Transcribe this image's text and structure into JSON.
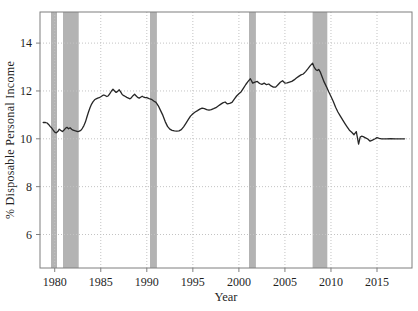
{
  "chart_data": {
    "type": "line",
    "title": "",
    "xlabel": "Year",
    "ylabel": "% Disposable Personal Income",
    "xlim": [
      1978.4,
      2018.8
    ],
    "ylim": [
      4.6,
      15.3
    ],
    "xticks": [
      1980,
      1985,
      1990,
      1995,
      2000,
      2005,
      2010,
      2015
    ],
    "yticks": [
      6,
      8,
      10,
      12,
      14
    ],
    "grid": "dotted, both axes",
    "legend": "none",
    "recession_bands": [
      [
        1979.6,
        1980.25
      ],
      [
        1980.9,
        1982.6
      ],
      [
        1990.35,
        1991.1
      ],
      [
        2001.1,
        2001.85
      ],
      [
        2008.0,
        2009.6
      ]
    ],
    "series": [
      {
        "name": "share of disposable personal income",
        "points": [
          [
            1978.75,
            10.68
          ],
          [
            1979.0,
            10.68
          ],
          [
            1979.17,
            10.66
          ],
          [
            1979.33,
            10.6
          ],
          [
            1979.5,
            10.52
          ],
          [
            1979.67,
            10.45
          ],
          [
            1979.83,
            10.36
          ],
          [
            1980.0,
            10.28
          ],
          [
            1980.17,
            10.25
          ],
          [
            1980.33,
            10.3
          ],
          [
            1980.5,
            10.4
          ],
          [
            1980.67,
            10.35
          ],
          [
            1980.83,
            10.3
          ],
          [
            1981.0,
            10.36
          ],
          [
            1981.17,
            10.44
          ],
          [
            1981.33,
            10.48
          ],
          [
            1981.5,
            10.42
          ],
          [
            1981.67,
            10.46
          ],
          [
            1981.83,
            10.4
          ],
          [
            1982.0,
            10.36
          ],
          [
            1982.17,
            10.34
          ],
          [
            1982.33,
            10.32
          ],
          [
            1982.5,
            10.3
          ],
          [
            1982.67,
            10.32
          ],
          [
            1982.83,
            10.35
          ],
          [
            1983.0,
            10.44
          ],
          [
            1983.17,
            10.55
          ],
          [
            1983.33,
            10.7
          ],
          [
            1983.5,
            10.92
          ],
          [
            1983.67,
            11.12
          ],
          [
            1983.83,
            11.3
          ],
          [
            1984.0,
            11.45
          ],
          [
            1984.17,
            11.55
          ],
          [
            1984.33,
            11.63
          ],
          [
            1984.5,
            11.67
          ],
          [
            1984.67,
            11.7
          ],
          [
            1984.83,
            11.72
          ],
          [
            1985.0,
            11.76
          ],
          [
            1985.17,
            11.8
          ],
          [
            1985.33,
            11.83
          ],
          [
            1985.5,
            11.8
          ],
          [
            1985.67,
            11.77
          ],
          [
            1985.83,
            11.8
          ],
          [
            1986.0,
            11.9
          ],
          [
            1986.17,
            12.0
          ],
          [
            1986.33,
            12.07
          ],
          [
            1986.5,
            12.0
          ],
          [
            1986.67,
            11.94
          ],
          [
            1986.83,
            11.98
          ],
          [
            1987.0,
            12.05
          ],
          [
            1987.17,
            11.95
          ],
          [
            1987.33,
            11.85
          ],
          [
            1987.5,
            11.8
          ],
          [
            1987.67,
            11.77
          ],
          [
            1987.83,
            11.73
          ],
          [
            1988.0,
            11.7
          ],
          [
            1988.17,
            11.67
          ],
          [
            1988.33,
            11.72
          ],
          [
            1988.5,
            11.8
          ],
          [
            1988.67,
            11.86
          ],
          [
            1988.83,
            11.8
          ],
          [
            1989.0,
            11.73
          ],
          [
            1989.17,
            11.7
          ],
          [
            1989.33,
            11.74
          ],
          [
            1989.5,
            11.78
          ],
          [
            1989.67,
            11.74
          ],
          [
            1989.83,
            11.72
          ],
          [
            1990.0,
            11.72
          ],
          [
            1990.25,
            11.68
          ],
          [
            1990.5,
            11.65
          ],
          [
            1990.75,
            11.58
          ],
          [
            1991.0,
            11.52
          ],
          [
            1991.25,
            11.38
          ],
          [
            1991.5,
            11.18
          ],
          [
            1991.75,
            10.98
          ],
          [
            1992.0,
            10.72
          ],
          [
            1992.25,
            10.52
          ],
          [
            1992.5,
            10.4
          ],
          [
            1992.75,
            10.35
          ],
          [
            1993.0,
            10.33
          ],
          [
            1993.25,
            10.32
          ],
          [
            1993.5,
            10.33
          ],
          [
            1993.75,
            10.38
          ],
          [
            1994.0,
            10.5
          ],
          [
            1994.25,
            10.65
          ],
          [
            1994.5,
            10.8
          ],
          [
            1994.75,
            10.95
          ],
          [
            1995.0,
            11.05
          ],
          [
            1995.25,
            11.12
          ],
          [
            1995.5,
            11.18
          ],
          [
            1995.75,
            11.24
          ],
          [
            1996.0,
            11.28
          ],
          [
            1996.25,
            11.26
          ],
          [
            1996.5,
            11.22
          ],
          [
            1996.75,
            11.2
          ],
          [
            1997.0,
            11.22
          ],
          [
            1997.25,
            11.26
          ],
          [
            1997.5,
            11.3
          ],
          [
            1997.75,
            11.37
          ],
          [
            1998.0,
            11.44
          ],
          [
            1998.25,
            11.5
          ],
          [
            1998.5,
            11.54
          ],
          [
            1998.75,
            11.46
          ],
          [
            1999.0,
            11.48
          ],
          [
            1999.25,
            11.52
          ],
          [
            1999.5,
            11.66
          ],
          [
            1999.75,
            11.79
          ],
          [
            2000.0,
            11.88
          ],
          [
            2000.25,
            11.97
          ],
          [
            2000.5,
            12.12
          ],
          [
            2000.75,
            12.27
          ],
          [
            2001.0,
            12.4
          ],
          [
            2001.25,
            12.51
          ],
          [
            2001.5,
            12.33
          ],
          [
            2001.75,
            12.37
          ],
          [
            2002.0,
            12.4
          ],
          [
            2002.25,
            12.31
          ],
          [
            2002.5,
            12.28
          ],
          [
            2002.75,
            12.33
          ],
          [
            2003.0,
            12.26
          ],
          [
            2003.25,
            12.29
          ],
          [
            2003.5,
            12.21
          ],
          [
            2003.75,
            12.16
          ],
          [
            2004.0,
            12.16
          ],
          [
            2004.25,
            12.26
          ],
          [
            2004.5,
            12.36
          ],
          [
            2004.75,
            12.43
          ],
          [
            2005.0,
            12.33
          ],
          [
            2005.25,
            12.34
          ],
          [
            2005.5,
            12.37
          ],
          [
            2005.75,
            12.4
          ],
          [
            2006.0,
            12.46
          ],
          [
            2006.25,
            12.54
          ],
          [
            2006.5,
            12.61
          ],
          [
            2006.75,
            12.67
          ],
          [
            2007.0,
            12.71
          ],
          [
            2007.25,
            12.81
          ],
          [
            2007.5,
            12.93
          ],
          [
            2007.75,
            13.06
          ],
          [
            2008.0,
            13.16
          ],
          [
            2008.17,
            13.0
          ],
          [
            2008.33,
            12.9
          ],
          [
            2008.5,
            12.85
          ],
          [
            2008.67,
            12.9
          ],
          [
            2008.83,
            12.8
          ],
          [
            2009.0,
            12.62
          ],
          [
            2009.25,
            12.38
          ],
          [
            2009.5,
            12.18
          ],
          [
            2009.75,
            11.97
          ],
          [
            2010.0,
            11.77
          ],
          [
            2010.25,
            11.56
          ],
          [
            2010.5,
            11.32
          ],
          [
            2010.75,
            11.12
          ],
          [
            2011.0,
            10.96
          ],
          [
            2011.25,
            10.8
          ],
          [
            2011.5,
            10.65
          ],
          [
            2011.75,
            10.5
          ],
          [
            2012.0,
            10.36
          ],
          [
            2012.25,
            10.27
          ],
          [
            2012.5,
            10.17
          ],
          [
            2012.75,
            10.3
          ],
          [
            2013.0,
            9.78
          ],
          [
            2013.17,
            10.07
          ],
          [
            2013.33,
            10.11
          ],
          [
            2013.5,
            10.09
          ],
          [
            2013.75,
            10.04
          ],
          [
            2014.0,
            9.99
          ],
          [
            2014.25,
            9.9
          ],
          [
            2014.5,
            9.94
          ],
          [
            2014.75,
            9.99
          ],
          [
            2015.0,
            10.05
          ],
          [
            2015.25,
            10.02
          ],
          [
            2015.5,
            10.0
          ],
          [
            2016.0,
            10.0
          ],
          [
            2016.5,
            10.01
          ],
          [
            2017.0,
            10.0
          ],
          [
            2017.5,
            10.0
          ],
          [
            2018.0,
            10.0
          ]
        ]
      }
    ],
    "colors": {
      "line": "#262626",
      "band": "#b3b3b3",
      "grid": "#c3c3c3",
      "frame": "#7f7f7f",
      "text": "#1f1f1f",
      "background": "#ffffff"
    }
  }
}
